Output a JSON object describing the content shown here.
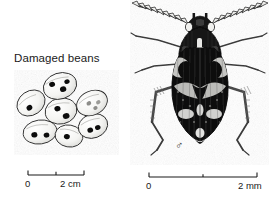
{
  "figure": {
    "background_color": "#ffffff",
    "ink_color": "#1a1a1a",
    "width": 269,
    "height": 201
  },
  "beans_panel": {
    "caption": "Damaged beans",
    "bean_count": 7,
    "description": "cluster of pale oval beans marked with dark circular emergence holes",
    "beans": [
      {
        "name": "bean-top",
        "cx": 46,
        "cy": 16,
        "rx": 17,
        "ry": 13,
        "rot": -18,
        "holes": [
          [
            -7,
            -4
          ],
          [
            2,
            4
          ],
          [
            8,
            -2
          ]
        ]
      },
      {
        "name": "bean-upper-left",
        "cx": 17,
        "cy": 33,
        "rx": 15,
        "ry": 12,
        "rot": -35,
        "holes": [
          [
            -4,
            3
          ]
        ]
      },
      {
        "name": "bean-center",
        "cx": 47,
        "cy": 41,
        "rx": 16,
        "ry": 13,
        "rot": -12,
        "holes": [
          [
            -3,
            -3
          ],
          [
            4,
            6
          ]
        ]
      },
      {
        "name": "bean-upper-right",
        "cx": 78,
        "cy": 33,
        "rx": 16,
        "ry": 12,
        "rot": -25,
        "holes": [
          [
            -3,
            -1
          ],
          [
            6,
            2
          ],
          [
            1,
            6
          ]
        ]
      },
      {
        "name": "bean-lower-left",
        "cx": 26,
        "cy": 62,
        "rx": 17,
        "ry": 12,
        "rot": -8,
        "holes": [
          [
            -6,
            2
          ],
          [
            6,
            4
          ]
        ]
      },
      {
        "name": "bean-lower-mid",
        "cx": 55,
        "cy": 66,
        "rx": 14,
        "ry": 11,
        "rot": 10,
        "holes": [
          [
            -2,
            1
          ]
        ]
      },
      {
        "name": "bean-lower-right",
        "cx": 79,
        "cy": 56,
        "rx": 15,
        "ry": 12,
        "rot": -20,
        "holes": [
          [
            -4,
            3
          ],
          [
            4,
            3
          ]
        ]
      }
    ]
  },
  "beetle_panel": {
    "sex_symbol": "♂",
    "sex_meaning": "male",
    "description": "dorsal view of a bean weevil with serrated antennae and mottled dark elytra"
  },
  "scale_bars": [
    {
      "name": "scale-bar-beans",
      "zero_label": "0",
      "max_label": "2 cm",
      "unit": "cm",
      "span": 2,
      "ticks": 3,
      "length_px": 56
    },
    {
      "name": "scale-bar-beetle",
      "zero_label": "0",
      "max_label": "2 mm",
      "unit": "mm",
      "span": 2,
      "ticks": 3,
      "length_px": 108
    }
  ]
}
